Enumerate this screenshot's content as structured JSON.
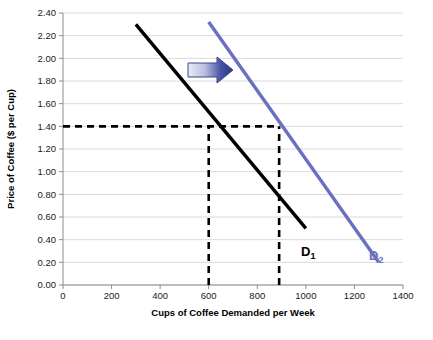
{
  "chart_data": {
    "type": "line",
    "title": "",
    "xlabel": "Cups of Coffee Demanded per Week",
    "ylabel": "Price of Coffee ($ per Cup)",
    "xlim": [
      0,
      1400
    ],
    "ylim": [
      0.0,
      2.4
    ],
    "grid": "horizontal",
    "legend": "inline-curve-labels",
    "xticks": [
      "0",
      "200",
      "400",
      "600",
      "800",
      "1000",
      "1200",
      "1400"
    ],
    "xtick_values": [
      0,
      200,
      400,
      600,
      800,
      1000,
      1200,
      1400
    ],
    "yticks": [
      "0.00",
      "0.20",
      "0.40",
      "0.60",
      "0.80",
      "1.00",
      "1.20",
      "1.40",
      "1.60",
      "1.80",
      "2.00",
      "2.20",
      "2.40"
    ],
    "ytick_values": [
      0.0,
      0.2,
      0.4,
      0.6,
      0.8,
      1.0,
      1.2,
      1.4,
      1.6,
      1.8,
      2.0,
      2.2,
      2.4
    ],
    "series": [
      {
        "name": "D1",
        "label": "D",
        "subscript": "1",
        "color": "#000000",
        "points": [
          [
            300,
            2.3
          ],
          [
            1000,
            0.5
          ]
        ],
        "label_x": 1010,
        "label_y": 0.26
      },
      {
        "name": "D2",
        "label": "D",
        "subscript": "2",
        "color": "#6b6fc0",
        "points": [
          [
            600,
            2.32
          ],
          [
            1300,
            0.2
          ]
        ],
        "label_x": 1290,
        "label_y": 0.22
      }
    ],
    "annotations": [
      {
        "name": "equilibrium-price-guide",
        "type": "dashed-horizontal",
        "value": 1.4,
        "from_x": 0,
        "to_x": 890,
        "color": "#000000"
      },
      {
        "name": "quantity-guide-d1",
        "type": "dashed-vertical",
        "value": 600,
        "from_y": 0.0,
        "to_y": 1.4,
        "color": "#000000"
      },
      {
        "name": "quantity-guide-d2",
        "type": "dashed-vertical",
        "value": 890,
        "from_y": 0.0,
        "to_y": 1.4,
        "color": "#000000"
      },
      {
        "name": "demand-shift-arrow",
        "type": "arrow",
        "direction": "right",
        "gradient_from": "#e8e8f5",
        "gradient_to": "#2b3580",
        "x_start": 188,
        "x_end": 233,
        "y_center": 70
      }
    ]
  },
  "colors": {
    "d1": "#000000",
    "d2": "#6b6fc0",
    "grid": "#d9d9d9",
    "axis": "#808080",
    "arrow_light": "#e8e8f5",
    "arrow_dark": "#2b3580"
  }
}
